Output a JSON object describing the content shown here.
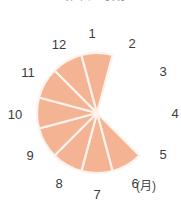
{
  "title": "出回り時期",
  "unit_label": "(月)",
  "accent_color": "#f4b393",
  "separator_color": "#fdf2ec",
  "background_color": "#ffffff",
  "label_color": "#3c3c3c",
  "months": [
    {
      "label": "1",
      "x": 92,
      "y": 33,
      "filled": false
    },
    {
      "label": "2",
      "x": 132,
      "y": 43,
      "filled": false
    },
    {
      "label": "3",
      "x": 163,
      "y": 71,
      "filled": false
    },
    {
      "label": "4",
      "x": 175,
      "y": 113,
      "filled": false
    },
    {
      "label": "5",
      "x": 163,
      "y": 154,
      "filled": true
    },
    {
      "label": "6",
      "x": 135,
      "y": 183,
      "filled": true
    },
    {
      "label": "7",
      "x": 97,
      "y": 194,
      "filled": true
    },
    {
      "label": "8",
      "x": 59,
      "y": 183,
      "filled": true
    },
    {
      "label": "9",
      "x": 30,
      "y": 155,
      "filled": true
    },
    {
      "label": "10",
      "x": 15,
      "y": 114,
      "filled": true
    },
    {
      "label": "11",
      "x": 28,
      "y": 72,
      "filled": true
    },
    {
      "label": "12",
      "x": 59,
      "y": 44,
      "filled": true
    }
  ],
  "chart_data": {
    "type": "pie",
    "title": "出回り時期",
    "xlabel": "(月)",
    "ylabel": "",
    "categories": [
      "1",
      "2",
      "3",
      "4",
      "5",
      "6",
      "7",
      "8",
      "9",
      "10",
      "11",
      "12"
    ],
    "values": [
      0,
      0,
      0,
      0,
      1,
      1,
      1,
      1,
      1,
      1,
      1,
      1
    ],
    "legend": [],
    "filled_months": [
      "5",
      "6",
      "7",
      "8",
      "9",
      "10",
      "11",
      "12"
    ],
    "empty_months": [
      "1",
      "2",
      "3",
      "4"
    ],
    "sector_degrees": 30,
    "grid": false,
    "legend_position": "none"
  },
  "geometry": {
    "center_x": 97,
    "center_y": 113,
    "radius": 60,
    "start_month": 5,
    "end_month": 12
  }
}
